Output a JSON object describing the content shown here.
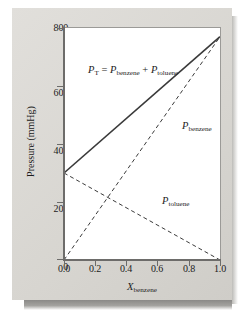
{
  "figure": {
    "background_color": "#dcdad6",
    "plot_background_color": "#ffffff",
    "axis_color": "#6d6c6a",
    "grid_color": "#d9d8d6",
    "line_color": "#3a3a3a"
  },
  "axes": {
    "y_title_text": "Pressure (mmHg)",
    "y_title_main": "Pressure (mmHg)",
    "x_title_symbol": "X",
    "x_title_sub": "benzene",
    "y_ticks": [
      "0",
      "200",
      "400",
      "600",
      "800"
    ],
    "x_ticks": [
      "0.0",
      "0.2",
      "0.4",
      "0.6",
      "0.8",
      "1.0"
    ]
  },
  "annotations": {
    "equation": {
      "p1_symbol": "P",
      "p1_sub": "T",
      "equals": "=",
      "p2_symbol": "P",
      "p2_sub": "benzene",
      "plus": "+",
      "p3_symbol": "P",
      "p3_sub": "toluene"
    },
    "benzene_label": {
      "symbol": "P",
      "sub": "benzene"
    },
    "toluene_label": {
      "symbol": "P",
      "sub": "toluene"
    }
  },
  "chart_data": {
    "type": "line",
    "title": "",
    "subtitle": "",
    "xlabel": "X_benzene",
    "ylabel": "Pressure (mmHg)",
    "xlim": [
      0.0,
      1.0
    ],
    "ylim": [
      0,
      800
    ],
    "xticks": [
      0.0,
      0.2,
      0.4,
      0.6,
      0.8,
      1.0
    ],
    "yticks": [
      0,
      200,
      400,
      600,
      800
    ],
    "grid": true,
    "legend": "none (inline annotations)",
    "annotation_equation": "P_T = P_benzene + P_toluene",
    "series": [
      {
        "name": "P_T = P_benzene + P_toluene",
        "style": "solid",
        "color": "#3a3a3a",
        "x": [
          0.0,
          0.2,
          0.4,
          0.6,
          0.8,
          1.0
        ],
        "values": [
          300,
          394,
          488,
          582,
          676,
          770
        ]
      },
      {
        "name": "P_benzene",
        "style": "dashed",
        "color": "#3a3a3a",
        "x": [
          0.0,
          0.2,
          0.4,
          0.6,
          0.8,
          1.0
        ],
        "values": [
          0,
          154,
          308,
          462,
          616,
          770
        ]
      },
      {
        "name": "P_toluene",
        "style": "dashed",
        "color": "#3a3a3a",
        "x": [
          0.0,
          0.2,
          0.4,
          0.6,
          0.8,
          1.0
        ],
        "values": [
          300,
          240,
          180,
          120,
          60,
          0
        ]
      }
    ]
  }
}
